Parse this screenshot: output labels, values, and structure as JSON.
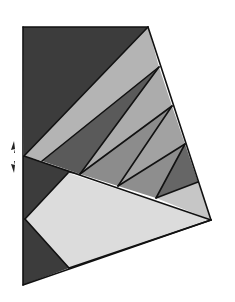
{
  "diagram": {
    "stroke_color": "#111111",
    "fold_marker": {
      "icon": "fold-arrows-icon",
      "position": [
        13,
        157
      ]
    },
    "regions": [
      {
        "id": "top-left-dark",
        "fill": "#3c3c3c",
        "points": "23,27 148,27 24,156"
      },
      {
        "id": "strip-1",
        "fill": "#b4b4b4",
        "points": "24,156 148,27 159,67 42,161"
      },
      {
        "id": "tri-2",
        "fill": "#5a5a5a",
        "points": "42,161 159,67 80,174"
      },
      {
        "id": "tri-3",
        "fill": "#acacac",
        "points": "80,174 159,67 172,106"
      },
      {
        "id": "tri-4",
        "fill": "#8c8c8c",
        "points": "80,174 172,106 118,186"
      },
      {
        "id": "tri-5",
        "fill": "#a2a2a2",
        "points": "118,186 172,106 185,144"
      },
      {
        "id": "tri-6",
        "fill": "#8e8e8e",
        "points": "118,186 185,144 156,198"
      },
      {
        "id": "tri-7",
        "fill": "#666666",
        "points": "156,198 185,144 198,182"
      },
      {
        "id": "tri-8",
        "fill": "#c6c6c6",
        "points": "156,198 198,182 211,220"
      },
      {
        "id": "left-mid-dark",
        "fill": "#3c3c3c",
        "points": "23,156 24,156 80,174 68,173 25,219 23,219"
      },
      {
        "id": "light-quad",
        "fill": "#dcdcdc",
        "points": "68,173 211,220 69,268 25,219"
      },
      {
        "id": "bottom-left-dark",
        "fill": "#3c3c3c",
        "points": "23,219 25,219 69,268 23,285"
      }
    ],
    "lines": [
      "23,27 148,27",
      "148,27 211,220",
      "211,220 23,285",
      "23,285 23,27",
      "24,156 148,27",
      "24,156 211,220",
      "42,161 159,67",
      "80,174 159,67",
      "80,174 172,106",
      "118,186 172,106",
      "118,186 185,144",
      "156,198 185,144",
      "156,198 198,182",
      "68,173 25,219",
      "25,219 69,268",
      "69,268 211,220"
    ]
  }
}
